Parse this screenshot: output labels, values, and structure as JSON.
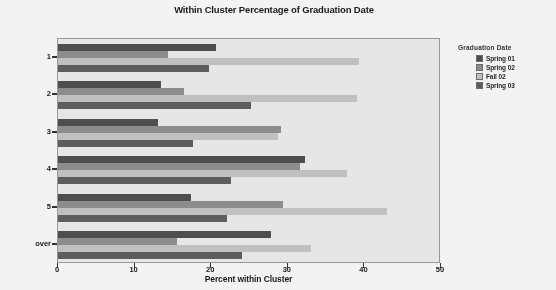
{
  "chart_data": {
    "type": "bar",
    "orientation": "horizontal",
    "title": "Within Cluster Percentage of Graduation Date",
    "xlabel": "Percent within Cluster",
    "ylabel": "Clust",
    "categories": [
      "1",
      "2",
      "3",
      "4",
      "5",
      "over"
    ],
    "xlim": [
      0,
      50
    ],
    "xticks": [
      0,
      10,
      20,
      30,
      40,
      50
    ],
    "xtick_labels": [
      "0",
      "10",
      "20",
      "30",
      "40",
      "50"
    ],
    "grid": false,
    "legend_position": "right",
    "legend_title": "Graduation Date",
    "series": [
      {
        "name": "Spring 01",
        "color": "#4a4a4a",
        "values": [
          20.6,
          13.4,
          13.0,
          32.2,
          17.4,
          27.8
        ]
      },
      {
        "name": "Spring 02",
        "color": "#8d8d8d",
        "values": [
          14.4,
          16.4,
          29.1,
          31.6,
          29.4,
          15.5
        ]
      },
      {
        "name": "Fall 02",
        "color": "#c6c6c6",
        "values": [
          39.3,
          39.0,
          28.7,
          37.7,
          43.0,
          33.0
        ]
      },
      {
        "name": "Spring 03",
        "color": "#5a5a5a",
        "values": [
          19.7,
          25.2,
          17.6,
          22.6,
          22.0,
          24.0
        ]
      }
    ]
  }
}
